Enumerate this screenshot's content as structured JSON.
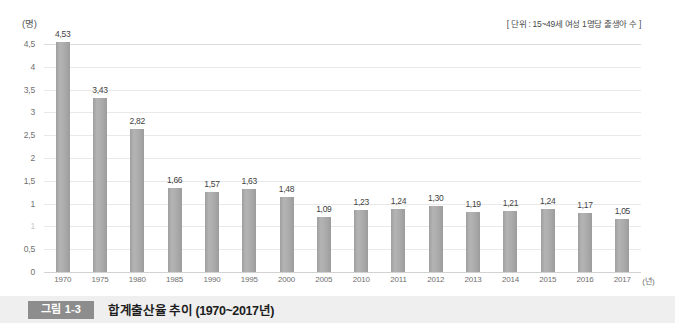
{
  "chart_data": {
    "type": "bar",
    "title": "합계출산율 추이 (1970~2017년)",
    "subtitle": "",
    "xlabel": "(년)",
    "ylabel": "(명)",
    "unit_note": "[ 단위 : 15~49세 여성 1명당 출생아 수 ]",
    "categories": [
      "1970",
      "1975",
      "1980",
      "1985",
      "1990",
      "1995",
      "2000",
      "2005",
      "2010",
      "2011",
      "2012",
      "2013",
      "2014",
      "2015",
      "2016",
      "2017"
    ],
    "values": [
      4.53,
      3.43,
      2.82,
      1.66,
      1.57,
      1.63,
      1.48,
      1.09,
      1.23,
      1.24,
      1.3,
      1.19,
      1.21,
      1.24,
      1.17,
      1.05
    ],
    "value_labels": [
      "4,53",
      "3,43",
      "2,82",
      "1,66",
      "1,57",
      "1,63",
      "1,48",
      "1,09",
      "1,23",
      "1,24",
      "1,30",
      "1,19",
      "1,21",
      "1,24",
      "1,17",
      "1,05"
    ],
    "ylim": [
      0,
      4.5
    ],
    "yticks": [
      4.5,
      4,
      3.5,
      3,
      2.5,
      2,
      1.5,
      1,
      1,
      0.5,
      0
    ],
    "ytick_labels": [
      "4,5",
      "4",
      "3,5",
      "3",
      "2,5",
      "2",
      "1,5",
      "1",
      "1",
      "0,5",
      "0"
    ],
    "grid": true,
    "legend": "none",
    "bar_color": "#a9a9a9",
    "grid_color": "#e9e9e9"
  },
  "caption": {
    "badge": "그림 1-3",
    "title": "합계출산율 추이 (1970~2017년)"
  }
}
